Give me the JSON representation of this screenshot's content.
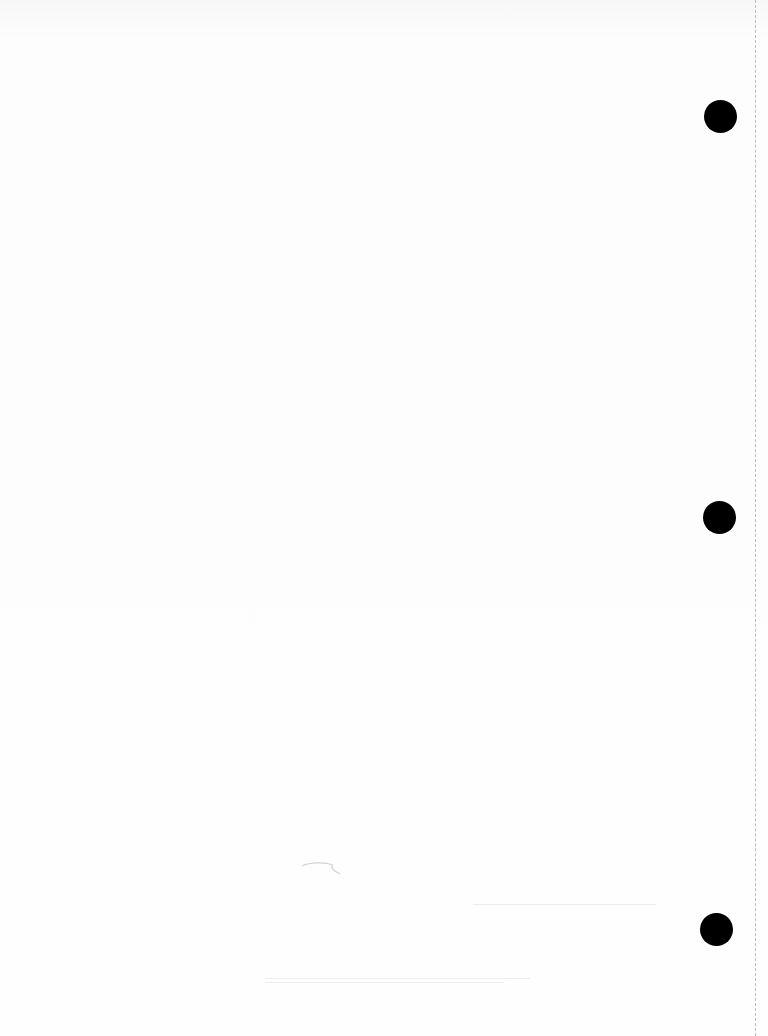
{
  "page": {
    "type": "blank scanned page",
    "background": "#fdfdfd",
    "punch_holes": [
      {
        "x": 720,
        "y": 116,
        "diameter": 33
      },
      {
        "x": 719,
        "y": 517,
        "diameter": 33
      },
      {
        "x": 716,
        "y": 929,
        "diameter": 33
      }
    ],
    "perforation_x": 755,
    "hole_color": "#000000"
  }
}
